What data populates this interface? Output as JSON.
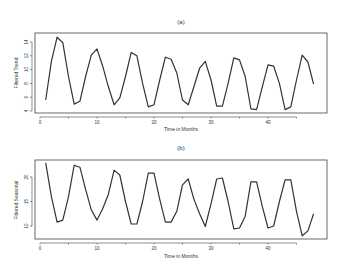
{
  "chart_data": [
    {
      "type": "line",
      "title": "(a)",
      "xlabel": "Time in Months",
      "ylabel": "Filtered Trend",
      "xlim": [
        0,
        48
      ],
      "ylim": [
        4,
        15
      ],
      "xticks": [
        0,
        10,
        20,
        30,
        40
      ],
      "yticks": [
        4,
        6,
        8,
        10,
        12,
        14
      ],
      "grid": false,
      "legend": null,
      "x": [
        1,
        2,
        3,
        4,
        5,
        6,
        7,
        8,
        9,
        10,
        11,
        12,
        13,
        14,
        15,
        16,
        17,
        18,
        19,
        20,
        21,
        22,
        23,
        24,
        25,
        26,
        27,
        28,
        29,
        30,
        31,
        32,
        33,
        34,
        35,
        36,
        37,
        38,
        39,
        40,
        41,
        42,
        43,
        44,
        45,
        46,
        47,
        48
      ],
      "series": [
        {
          "name": "Filtered Trend",
          "values": [
            5.6,
            11.2,
            14.7,
            13.9,
            9.0,
            5.0,
            5.4,
            9.0,
            12.1,
            13.0,
            10.5,
            7.5,
            4.9,
            5.9,
            9.0,
            12.5,
            12.0,
            8.0,
            4.6,
            4.9,
            8.5,
            11.8,
            11.5,
            9.5,
            5.6,
            4.9,
            7.5,
            10.2,
            11.2,
            8.5,
            4.7,
            4.7,
            8.0,
            11.7,
            11.4,
            9.0,
            4.3,
            4.2,
            7.5,
            10.7,
            10.5,
            8.0,
            4.2,
            4.6,
            8.5,
            12.1,
            11.1,
            7.9
          ]
        }
      ]
    },
    {
      "type": "line",
      "title": "(b)",
      "xlabel": "Time in Months",
      "ylabel": "Filtered Seasonal",
      "xlim": [
        0,
        48
      ],
      "ylim": [
        7,
        24
      ],
      "xticks": [
        0,
        10,
        20,
        30,
        40
      ],
      "yticks": [
        10,
        15,
        20
      ],
      "grid": false,
      "legend": null,
      "x": [
        1,
        2,
        3,
        4,
        5,
        6,
        7,
        8,
        9,
        10,
        11,
        12,
        13,
        14,
        15,
        16,
        17,
        18,
        19,
        20,
        21,
        22,
        23,
        24,
        25,
        26,
        27,
        28,
        29,
        30,
        31,
        32,
        33,
        34,
        35,
        36,
        37,
        38,
        39,
        40,
        41,
        42,
        43,
        44,
        45,
        46,
        47,
        48
      ],
      "series": [
        {
          "name": "Filtered Seasonal",
          "values": [
            22.9,
            16.0,
            10.8,
            11.2,
            16.0,
            22.4,
            22.0,
            17.5,
            13.3,
            11.2,
            13.5,
            16.5,
            21.4,
            20.4,
            15.0,
            10.4,
            10.4,
            15.0,
            20.8,
            20.8,
            15.5,
            10.8,
            10.8,
            13.0,
            18.4,
            19.6,
            15.5,
            12.5,
            9.9,
            14.5,
            19.6,
            19.8,
            15.0,
            9.4,
            9.6,
            12.0,
            19.0,
            19.0,
            14.0,
            9.6,
            10.0,
            15.0,
            19.4,
            19.4,
            13.0,
            8.0,
            9.0,
            12.5
          ]
        }
      ]
    }
  ],
  "panels": [
    {
      "title": "(a)",
      "xlabel": "Time in Months",
      "ylabel": "Filtered Trend"
    },
    {
      "title": "(b)",
      "xlabel": "Time in Months",
      "ylabel": "Filtered Seasonal"
    }
  ]
}
